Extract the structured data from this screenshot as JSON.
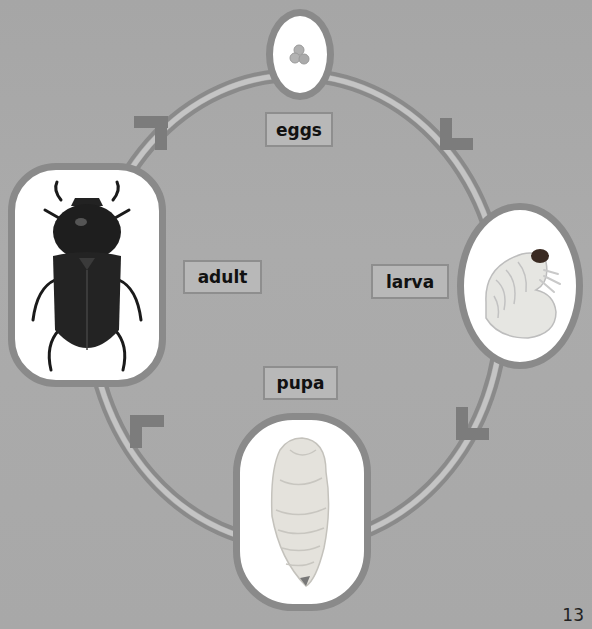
{
  "diagram": {
    "stages": [
      {
        "id": "eggs",
        "label": "eggs",
        "image": "eggs-illustration"
      },
      {
        "id": "larva",
        "label": "larva",
        "image": "larva-grub-photo"
      },
      {
        "id": "pupa",
        "label": "pupa",
        "image": "pupa-photo"
      },
      {
        "id": "adult",
        "label": "adult",
        "image": "adult-beetle-photo"
      }
    ],
    "flow": "clockwise",
    "colors": {
      "background": "#a9a9a9",
      "ring": "#8a8a8a",
      "arrow": "#7c7c7c",
      "label_box": "#b8b8b8"
    }
  },
  "page": {
    "number": "13"
  }
}
